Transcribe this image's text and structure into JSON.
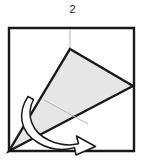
{
  "diagram": {
    "type": "origami-fold-instruction",
    "step_label": "2",
    "title_visible_text": "2",
    "colors": {
      "outline": "#1a1a1a",
      "paper_fill": "#ffffff",
      "flap_fill": "#e6e6e6",
      "crease_line": "#b5b5b5",
      "arrow_fill": "#ffffff",
      "arrow_outline": "#1a1a1a",
      "background": "#ffffff"
    },
    "elements": {
      "paper_square": {
        "name": "paper-square",
        "description": "outer square sheet outline",
        "points": "9,28 134,28 134,151 9,151",
        "stroke_width": 2.4
      },
      "crease_guide": {
        "name": "vertical-crease-guide",
        "description": "faint vertical crease from top edge down to flap apex",
        "x1": 70,
        "y1": 29,
        "x2": 70,
        "y2": 49,
        "stroke_width": 1.2
      },
      "flap_cone": {
        "name": "folded-cone-flap",
        "description": "large shaded kite/cone shape folded from bottom-left corner",
        "points": "70,49 133,86 9,151",
        "stroke_width": 2.4
      },
      "flap_crease": {
        "name": "flap-interior-crease",
        "description": "faint interior crease line across the cone",
        "x1": 44,
        "y1": 100,
        "x2": 86,
        "y2": 123,
        "stroke_width": 1.0
      },
      "fold_arrow": {
        "name": "fold-direction-arrow",
        "description": "curved white banded arrow wrapping the cone, pointing down-right",
        "direction": "down-right",
        "stroke_width": 1.6
      }
    }
  }
}
